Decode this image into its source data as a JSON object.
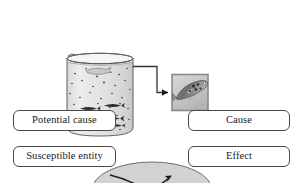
{
  "figure": {
    "title": "",
    "colors": {
      "ellipse_fill": "#d2d2d2",
      "ellipse_stroke": "#6e6e6e",
      "box_border": "#4a4a4a",
      "box_fill": "#ffffff",
      "arrow": "#1a1a1a",
      "beaker_water": "#e3e3e3",
      "beaker_glass": "#7a7a7a",
      "fish_body": "#2b2b2b",
      "inset_border": "#8a8a8a",
      "inset_fill": "#c9c9c9",
      "connector": "#3a3a3a",
      "page_background": "#ffffff"
    }
  },
  "illustration": {
    "beaker": {
      "name": "beaker-with-fish",
      "water_label": "",
      "fish_count": 6,
      "particle_count": 34
    },
    "inset": {
      "name": "magnified-fish-inset",
      "caption": "",
      "spot_count": 5
    },
    "connector": {
      "name": "magnify-connector-arrow",
      "label": ""
    }
  },
  "diagram": {
    "type": "cause-effect-mapping",
    "nodes": [
      {
        "id": "potential-cause",
        "label": "Potential cause",
        "side": "left",
        "row": "top"
      },
      {
        "id": "susceptible-entity",
        "label": "Susceptible entity",
        "side": "left",
        "row": "bottom"
      },
      {
        "id": "cause",
        "label": "Cause",
        "side": "right",
        "row": "top"
      },
      {
        "id": "effect",
        "label": "Effect",
        "side": "right",
        "row": "bottom"
      }
    ],
    "links": [
      {
        "from": "susceptible-entity",
        "to": "cause",
        "style": "curved-arrow"
      },
      {
        "from": "potential-cause",
        "to": "effect",
        "style": "curved-arrow"
      }
    ],
    "ellipse": {
      "name": "crossing-region-ellipse",
      "label": ""
    }
  }
}
